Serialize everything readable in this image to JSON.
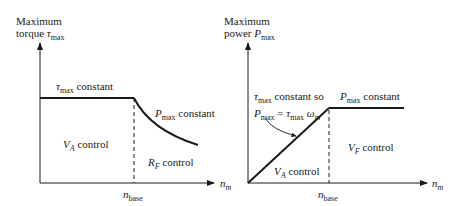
{
  "left_chart": {
    "y_axis_label_line1": "Maximum",
    "y_axis_label_line2_prefix": "torque ",
    "y_axis_symbol": "τ",
    "y_axis_symbol_sub": "max",
    "x_axis_symbol": "n",
    "x_axis_symbol_sub": "m",
    "base_tick_symbol": "n",
    "base_tick_sub": "base",
    "annotation_top_symbol": "τ",
    "annotation_top_sub": "max",
    "annotation_top_text": " constant",
    "annotation_curve_symbol": "P",
    "annotation_curve_sub": "max",
    "annotation_curve_text": " constant",
    "region_left_symbol": "V",
    "region_left_sub": "A",
    "region_left_text": " control",
    "region_right_symbol": "R",
    "region_right_sub": "F",
    "region_right_text": " control"
  },
  "right_chart": {
    "y_axis_label_line1": "Maximum",
    "y_axis_label_line2_prefix": "power ",
    "y_axis_symbol": "P",
    "y_axis_symbol_sub": "max",
    "x_axis_symbol": "n",
    "x_axis_symbol_sub": "m",
    "base_tick_symbol": "n",
    "base_tick_sub": "base",
    "annotation_ramp_line1_symbol": "τ",
    "annotation_ramp_line1_sub": "max",
    "annotation_ramp_line1_text": " constant so",
    "annotation_ramp_line2_p": "P",
    "annotation_ramp_line2_p_sub": "max",
    "annotation_ramp_line2_eq": " = ",
    "annotation_ramp_line2_tau": "τ",
    "annotation_ramp_line2_tau_sub": "max",
    "annotation_ramp_line2_omega": " ω",
    "annotation_ramp_line2_omega_sub": "m",
    "annotation_flat_symbol": "P",
    "annotation_flat_sub": "max",
    "annotation_flat_text": " constant",
    "region_left_symbol": "V",
    "region_left_sub": "A",
    "region_left_text": " control",
    "region_right_symbol": "V",
    "region_right_sub": "F",
    "region_right_text": " control"
  },
  "colors": {
    "line": "#1a1a1a",
    "background": "#ffffff"
  }
}
